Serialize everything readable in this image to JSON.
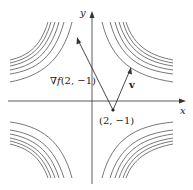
{
  "diagram": {
    "axes": {
      "x_label": "x",
      "y_label": "y"
    },
    "point": {
      "label": "(2, −1)"
    },
    "gradient_vector": {
      "label_nabla": "∇",
      "label_f": "f",
      "label_args": "(2, −1)"
    },
    "direction_vector": {
      "label": "v"
    },
    "colors": {
      "curves": "#555555",
      "axes": "#333333",
      "text": "#222222"
    }
  }
}
